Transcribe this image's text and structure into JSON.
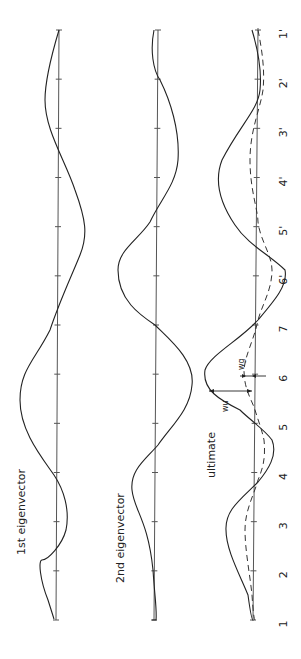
{
  "figure": {
    "panels": [
      {
        "id": "first",
        "title": "1st eigenvector",
        "axis_x": 54,
        "has_dashed": false
      },
      {
        "id": "second",
        "title": "2nd eigenvector",
        "axis_x": 152,
        "has_dashed": false
      },
      {
        "id": "ultimate",
        "title": "ultimate",
        "axis_x": 256,
        "has_dashed": true
      }
    ],
    "node_labels": [
      "1",
      "2",
      "3",
      "4",
      "5",
      "6",
      "7",
      "6'",
      "5'",
      "4'",
      "3'",
      "2'",
      "1'"
    ],
    "annotations": {
      "wu": "wu",
      "wg": "wg"
    },
    "colors": {
      "line": "#222222",
      "axis": "#555555",
      "background": "#ffffff"
    }
  }
}
